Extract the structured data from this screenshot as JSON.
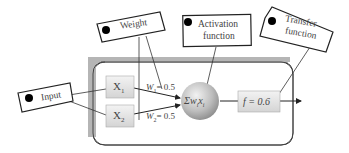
{
  "diagram": {
    "tags": {
      "weight": "Weight",
      "activation_line1": "Activation",
      "activation_line2": "function",
      "transfer_line1": "Transfer",
      "transfer_line2": "function",
      "input": "Input"
    },
    "nodes": {
      "x1": "X",
      "x1_sub": "1",
      "x2": "X",
      "x2_sub": "2",
      "sum": "Σw",
      "sum_sub_i": "i",
      "sum_x": "x",
      "transfer": "f = 0.6"
    },
    "weights": {
      "w1_label": "W",
      "w1_sub": "1",
      "w1_value": "= 0.5",
      "w2_label": "W",
      "w2_sub": "2",
      "w2_value": "= 0.5"
    },
    "colors": {
      "frame_gray": "#b5b5b5",
      "frame_border": "#444444",
      "node_fill": "#e6e6e6",
      "sphere_mid": "#bdbdbd",
      "line": "#333333"
    }
  }
}
